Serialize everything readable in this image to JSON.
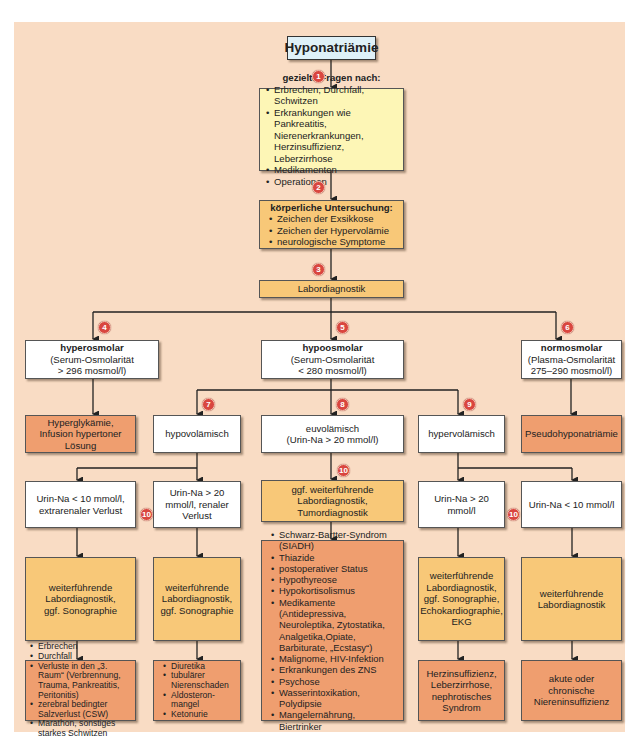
{
  "title": "Hyponatriämie",
  "colors": {
    "background": "#f9dcc4",
    "title_box": "#dff1f8",
    "question_box": "#fdf6b6",
    "diagnostic_box": "#f8c878",
    "result_box": "#ef9e6f",
    "badge": "#d9463f"
  },
  "badges": [
    "1",
    "2",
    "3",
    "4",
    "5",
    "6",
    "7",
    "8",
    "9",
    "10",
    "10",
    "10"
  ],
  "step1": {
    "heading": "gezielte Fragen nach:",
    "items": [
      "Erbrechen, Durchfall, Schwitzen",
      "Erkrankungen wie Pankreatitis, Nierenerkrankungen, Herzinsuffizienz, Leberzirrhose",
      "Medikamenten",
      "Operationen"
    ]
  },
  "step2": {
    "heading": "körperliche Untersuchung:",
    "items": [
      "Zeichen der Exsikkose",
      "Zeichen der Hypervolämie",
      "neurologische Symptome"
    ]
  },
  "step3": {
    "label": "Labordiagnostik"
  },
  "osmolarity": {
    "hyper": {
      "heading": "hyperosmolar",
      "line1": "(Serum-Osmolarität",
      "line2": "> 296 mosmol/l)"
    },
    "hypo": {
      "heading": "hypoosmolar",
      "line1": "(Serum-Osmolarität",
      "line2": "< 280 mosmol/l)"
    },
    "normo": {
      "heading": "normosmolar",
      "line1": "(Plasma-Osmolarität",
      "line2": "275–290 mosmol/l)"
    }
  },
  "hyper_result": "Hyperglykämie, Infusion hypertoner Lösung",
  "normo_result": "Pseudohyponatriämie",
  "volume": {
    "hypo": "hypovolämisch",
    "eu_line1": "euvolämisch",
    "eu_line2": "(Urin-Na > 20 mmol/l)",
    "hyper": "hypervolämisch"
  },
  "urine": {
    "hypo_low": "Urin-Na < 10 mmol/l, extrarenaler Verlust",
    "hypo_high": "Urin-Na > 20 mmol/l, renaler Verlust",
    "hyper_high": "Urin-Na > 20 mmol/l",
    "hyper_low": "Urin-Na < 10 mmol/l"
  },
  "diagnostics": {
    "eu": "ggf. weiterführende Labordiagnostik, Tumordiagnostik",
    "hypo_low": "weiterführende Labordiagnostik, ggf. Sonographie",
    "hypo_high": "weiterführende Labordiagnostik, ggf. Sonographie",
    "hyper_high": "weiterführende Labordiagnostik, ggf. Sonographie, Echokardiographie, EKG",
    "hyper_low": "weiterführende Labordiagnostik"
  },
  "causes": {
    "extrarenal": [
      "Erbrechen",
      "Durchfall",
      "Verluste in den „3. Raum“ (Verbrennung, Trauma, Pankreatitis, Peritonitis)",
      "zerebral bedingter Salzverlust (CSW)",
      "Marathon, sonstiges starkes Schwitzen"
    ],
    "renal": [
      "Diuretika",
      "tubulärer Nierenschaden",
      "Aldosteron-mangel",
      "Ketonurie"
    ],
    "euvolemic": [
      "Schwarz-Bartter-Syndrom (SIADH)",
      "Thiazide",
      "postoperativer Status",
      "Hypothyreose",
      "Hypokortisolismus",
      "Medikamente (Antidepressiva, Neuroleptika, Zytostatika, Analgetika,Opiate, Barbiturate, „Ecstasy“)",
      "Malignome, HIV-Infektion",
      "Erkrankungen des ZNS",
      "Psychose",
      "Wasserintoxikation, Polydipsie",
      "Mangelernährung, Biertrinker"
    ],
    "hyper_high": "Herzinsuffizienz, Leberzirrhose, nephrotisches Syndrom",
    "hyper_low": "akute oder chronische Niereninsuffizienz"
  }
}
